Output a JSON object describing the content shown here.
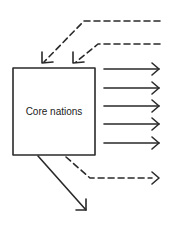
{
  "diagram": {
    "core_box": {
      "label": "Core nations"
    },
    "colors": {
      "stroke": "#2a2a2a",
      "background": "#ffffff"
    },
    "incoming_dashed_arrows": 2,
    "outgoing_solid_arrows_right": 5,
    "outgoing_dashed_arrows_right": 1,
    "outgoing_solid_arrow_down": 1
  }
}
